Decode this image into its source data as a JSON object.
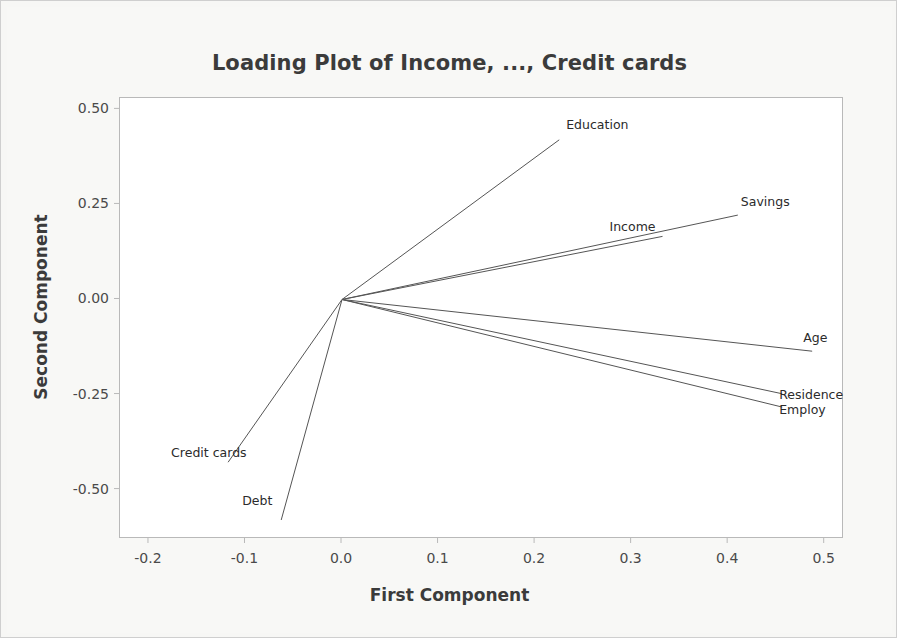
{
  "chart_data": {
    "type": "scatter",
    "title": "Loading Plot of Income, ..., Credit cards",
    "xlabel": "First Component",
    "ylabel": "Second Component",
    "xlim": [
      -0.23,
      0.52
    ],
    "ylim": [
      -0.63,
      0.53
    ],
    "xticks": [
      "-0.2",
      "-0.1",
      "0.0",
      "0.1",
      "0.2",
      "0.3",
      "0.4",
      "0.5"
    ],
    "xtick_values": [
      -0.2,
      -0.1,
      0.0,
      0.1,
      0.2,
      0.3,
      0.4,
      0.5
    ],
    "yticks": [
      "0.50",
      "0.25",
      "0.00",
      "-0.25",
      "-0.50"
    ],
    "ytick_values": [
      0.5,
      0.25,
      0.0,
      -0.25,
      -0.5
    ],
    "grid": false,
    "legend": "none",
    "origin": [
      0.0,
      0.0
    ],
    "line_color": "#555555",
    "vectors": [
      {
        "label": "Education",
        "x": 0.225,
        "y": 0.42,
        "label_dx": 8,
        "label_dy": -22
      },
      {
        "label": "Savings",
        "x": 0.41,
        "y": 0.222,
        "label_dx": 4,
        "label_dy": -20
      },
      {
        "label": "Income",
        "x": 0.332,
        "y": 0.166,
        "label_dx": -52,
        "label_dy": -16
      },
      {
        "label": "Age",
        "x": 0.487,
        "y": -0.136,
        "label_dx": -8,
        "label_dy": -20
      },
      {
        "label": "Residence",
        "x": 0.456,
        "y": -0.248,
        "label_dx": -2,
        "label_dy": -6
      },
      {
        "label": "Employ",
        "x": 0.456,
        "y": -0.283,
        "label_dx": -2,
        "label_dy": -4
      },
      {
        "label": "Credit cards",
        "x": -0.118,
        "y": -0.428,
        "label_dx": -56,
        "label_dy": -16
      },
      {
        "label": "Debt",
        "x": -0.063,
        "y": -0.58,
        "label_dx": -38,
        "label_dy": -26
      }
    ]
  }
}
